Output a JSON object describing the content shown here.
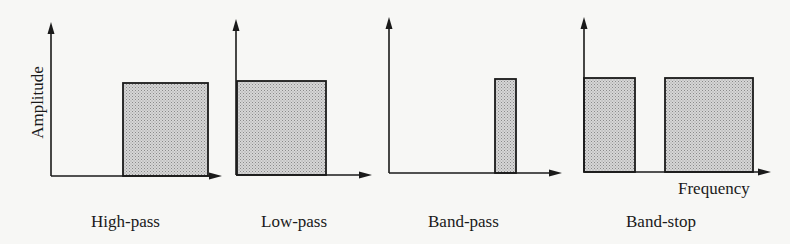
{
  "diagram": {
    "y_axis_label": "Amplitude",
    "x_axis_label": "Frequency",
    "fill_color": "#c6c6c6",
    "line_color": "#1a1a1a",
    "panels": [
      {
        "id": "high-pass",
        "label": "High-pass",
        "axis": {
          "x0": 51,
          "y_bottom": 176,
          "y_top": 22,
          "x_tip": 222
        },
        "bands": [
          {
            "x1": 123,
            "x2": 208,
            "top": 83
          }
        ]
      },
      {
        "id": "low-pass",
        "label": "Low-pass",
        "axis": {
          "x0": 236,
          "y_bottom": 175,
          "y_top": 19,
          "x_tip": 372
        },
        "bands": [
          {
            "x1": 237,
            "x2": 326,
            "top": 81
          }
        ]
      },
      {
        "id": "band-pass",
        "label": "Band-pass",
        "axis": {
          "x0": 389,
          "y_bottom": 173,
          "y_top": 17,
          "x_tip": 562
        },
        "bands": [
          {
            "x1": 495,
            "x2": 516,
            "top": 79
          }
        ]
      },
      {
        "id": "band-stop",
        "label": "Band-stop",
        "axis": {
          "x0": 584,
          "y_bottom": 172,
          "y_top": 17,
          "x_tip": 771
        },
        "bands": [
          {
            "x1": 584,
            "x2": 635,
            "top": 78
          },
          {
            "x1": 665,
            "x2": 753,
            "top": 78
          }
        ]
      }
    ]
  }
}
